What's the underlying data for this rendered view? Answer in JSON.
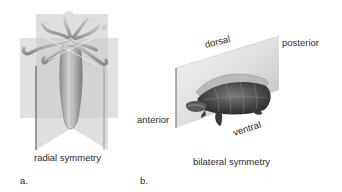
{
  "figure": {
    "panels": [
      {
        "id": "a",
        "letter": "a.",
        "caption": "radial symmetry",
        "subject": "hydra-like radially symmetric animal with intersecting planes"
      },
      {
        "id": "b",
        "letter": "b.",
        "caption": "bilateral symmetry",
        "subject": "turtle bisected by sagittal plane",
        "orientation_labels": {
          "dorsal": "dorsal",
          "posterior": "posterior",
          "anterior": "anterior",
          "ventral": "ventral"
        }
      }
    ]
  }
}
